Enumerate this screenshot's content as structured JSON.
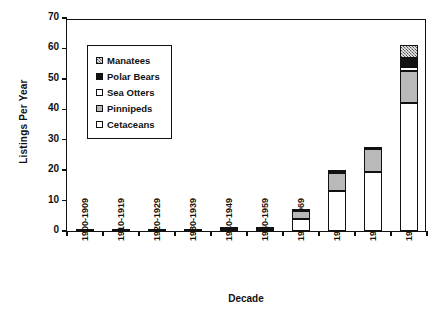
{
  "chart_data": {
    "type": "bar",
    "subtype": "stacked-vertical",
    "title": "",
    "xlabel": "Decade",
    "ylabel": "Listings Per Year",
    "ylim": [
      0,
      70
    ],
    "yticks": [
      0,
      10,
      20,
      30,
      40,
      50,
      60,
      70
    ],
    "grid": false,
    "legend_position": "upper-left-inside",
    "categories": [
      "1900-1909",
      "1910-1919",
      "1920-1929",
      "1930-1939",
      "1940-1949",
      "1950-1959",
      "1960-1969",
      "1970-1979",
      "1980-1989",
      "1990-1996"
    ],
    "series": [
      {
        "name": "Cetaceans",
        "swatch": "white",
        "color": "#ffffff",
        "values": [
          0.1,
          0.1,
          0.2,
          0.2,
          0.5,
          0.4,
          4.0,
          13.0,
          19.5,
          42.0
        ]
      },
      {
        "name": "Pinnipeds",
        "swatch": "light-gray",
        "color": "#b9b9b9",
        "values": [
          0,
          0,
          0,
          0,
          0.2,
          0.4,
          2.5,
          6.0,
          7.5,
          10.5
        ]
      },
      {
        "name": "Sea Otters",
        "swatch": "white",
        "color": "#ffffff",
        "values": [
          0,
          0,
          0,
          0,
          0,
          0,
          0,
          0,
          0,
          1.5
        ]
      },
      {
        "name": "Polar Bears",
        "swatch": "solid-black",
        "color": "#131313",
        "values": [
          0,
          0,
          0,
          0,
          0.1,
          0.2,
          0.2,
          0.9,
          0.7,
          3.0
        ]
      },
      {
        "name": "Manatees",
        "swatch": "checkered-hatch",
        "color": "#9a9a9a",
        "values": [
          0,
          0,
          0,
          0,
          0,
          0,
          0,
          0,
          0,
          4.0
        ]
      }
    ],
    "stack_order_bottom_to_top": [
      "Cetaceans",
      "Pinnipeds",
      "Sea Otters",
      "Polar Bears",
      "Manatees"
    ],
    "totals": [
      0.1,
      0.1,
      0.2,
      0.2,
      0.8,
      1.0,
      6.7,
      19.9,
      27.7,
      61.0
    ]
  },
  "legend": {
    "items": [
      {
        "label": "Manatees"
      },
      {
        "label": "Polar Bears"
      },
      {
        "label": "Sea Otters"
      },
      {
        "label": "Pinnipeds"
      },
      {
        "label": "Cetaceans"
      }
    ]
  },
  "axes": {
    "y_title": "Listings Per Year",
    "x_title": "Decade",
    "y_tick_labels": [
      "0",
      "10",
      "20",
      "30",
      "40",
      "50",
      "60",
      "70"
    ]
  }
}
